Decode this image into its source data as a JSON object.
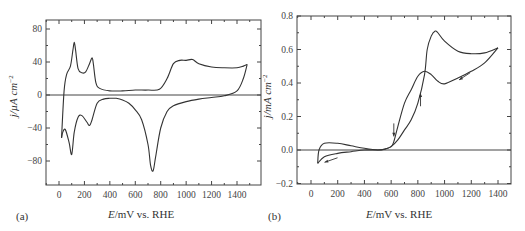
{
  "chart_data": [
    {
      "panel": "(a)",
      "type": "line",
      "title": "",
      "xlabel": "E/mV vs. RHE",
      "ylabel": "j/µA cm−2",
      "xlim": [
        -100,
        1550
      ],
      "ylim": [
        -110,
        95
      ],
      "xticks": [
        0,
        200,
        400,
        600,
        800,
        1000,
        1200,
        1400
      ],
      "yticks": [
        80,
        40,
        0,
        -40,
        -80
      ],
      "grid": false,
      "legend": null,
      "series": [
        {
          "name": "anodic sweep",
          "x": [
            20,
            40,
            60,
            90,
            110,
            120,
            130,
            150,
            180,
            210,
            240,
            260,
            270,
            290,
            320,
            400,
            500,
            600,
            700,
            790,
            850,
            900,
            950,
            1000,
            1050,
            1100,
            1200,
            1300,
            1400,
            1450,
            1480
          ],
          "y": [
            -52,
            5,
            25,
            35,
            55,
            64,
            55,
            32,
            27,
            28,
            38,
            45,
            38,
            15,
            8,
            5,
            5,
            6,
            6,
            7,
            20,
            38,
            42,
            42,
            43,
            38,
            34,
            33,
            33,
            35,
            37
          ]
        },
        {
          "name": "cathodic sweep",
          "x": [
            1480,
            1450,
            1400,
            1300,
            1200,
            1100,
            1000,
            900,
            850,
            800,
            760,
            740,
            720,
            700,
            650,
            600,
            550,
            500,
            450,
            420,
            400,
            350,
            300,
            260,
            240,
            220,
            180,
            150,
            120,
            100,
            80,
            50,
            30,
            20
          ],
          "y": [
            37,
            20,
            5,
            -1,
            -3,
            -5,
            -8,
            -13,
            -20,
            -40,
            -75,
            -92,
            -85,
            -60,
            -30,
            -18,
            -10,
            -6,
            -4,
            -4,
            -4,
            -5,
            -10,
            -30,
            -37,
            -33,
            -25,
            -27,
            -45,
            -72,
            -58,
            -42,
            -45,
            -52
          ]
        }
      ],
      "annotations": []
    },
    {
      "panel": "(b)",
      "type": "line",
      "title": "",
      "xlabel": "E/mV vs. RHE",
      "ylabel": "j/mA cm−2",
      "xlim": [
        -100,
        1450
      ],
      "ylim": [
        -0.2,
        0.8
      ],
      "xticks": [
        0,
        200,
        400,
        600,
        800,
        1000,
        1200,
        1400
      ],
      "yticks": [
        0.8,
        0.6,
        0.4,
        0.2,
        0.0,
        -0.2
      ],
      "grid": false,
      "legend": null,
      "series": [
        {
          "name": "anodic sweep",
          "x": [
            50,
            100,
            200,
            300,
            400,
            500,
            550,
            600,
            650,
            700,
            750,
            800,
            850,
            870,
            900,
            930,
            950,
            1000,
            1100,
            1200,
            1300,
            1400
          ],
          "y": [
            -0.08,
            -0.04,
            -0.02,
            -0.01,
            0.0,
            0.0,
            0.005,
            0.02,
            0.06,
            0.12,
            0.18,
            0.28,
            0.45,
            0.6,
            0.68,
            0.71,
            0.7,
            0.65,
            0.59,
            0.575,
            0.58,
            0.61
          ]
        },
        {
          "name": "cathodic sweep",
          "x": [
            1400,
            1300,
            1200,
            1100,
            1000,
            950,
            900,
            850,
            800,
            750,
            700,
            650,
            620,
            600,
            550,
            500,
            400,
            300,
            200,
            100,
            60,
            50
          ],
          "y": [
            0.61,
            0.52,
            0.47,
            0.43,
            0.395,
            0.41,
            0.45,
            0.47,
            0.44,
            0.36,
            0.28,
            0.14,
            0.05,
            0.02,
            0.005,
            0.0,
            0.01,
            0.025,
            0.04,
            0.04,
            0.0,
            -0.08
          ]
        }
      ],
      "annotations": [
        {
          "type": "arrow",
          "near": [
            620,
            0.12
          ],
          "direction": "down"
        },
        {
          "type": "arrow",
          "near": [
            820,
            0.3
          ],
          "direction": "up"
        },
        {
          "type": "arrow",
          "near": [
            1150,
            0.44
          ],
          "direction": "down-left"
        },
        {
          "type": "arrow",
          "near": [
            150,
            -0.06
          ],
          "direction": "left"
        }
      ]
    }
  ],
  "labels": {
    "panel_a": "(a)",
    "panel_b": "(b)",
    "xlabel_a_italic": "E",
    "xlabel_a_rest": "/mV vs. RHE",
    "xlabel_b_italic": "E",
    "xlabel_b_rest": "/mV vs. RHE",
    "ylabel_a": "j/µA cm",
    "ylabel_a_sup": "−2",
    "ylabel_b": "j/mA cm",
    "ylabel_b_sup": "−2"
  },
  "colors": {
    "line": "#333333",
    "axis": "#444444"
  }
}
